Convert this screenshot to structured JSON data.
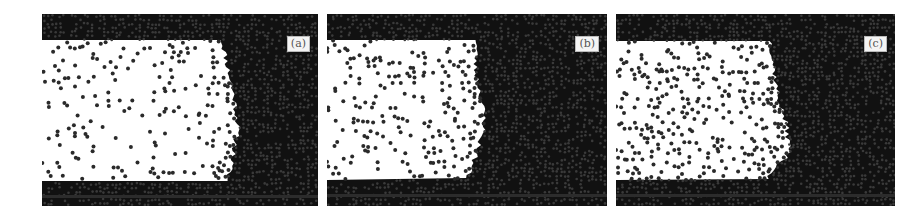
{
  "figure": {
    "background": "#ffffff",
    "particle_color": "#2a2a2a",
    "dense_color": "#111111",
    "void_color": "#ffffff",
    "panels": [
      {
        "id": "a",
        "label": "(a)",
        "left": 42,
        "width": 276,
        "front": [
          180,
          186,
          192,
          196,
          192,
          185
        ],
        "void_top": 26,
        "void_bottom": 167,
        "dot_density": 0.35,
        "seed": 11
      },
      {
        "id": "b",
        "label": "(b)",
        "left": 327,
        "width": 280,
        "front": [
          150,
          148,
          154,
          158,
          150,
          140
        ],
        "void_top": 26,
        "void_bottom": 166,
        "dot_density": 0.5,
        "seed": 23
      },
      {
        "id": "c",
        "label": "(c)",
        "left": 616,
        "width": 279,
        "front": [
          155,
          158,
          162,
          170,
          174,
          150
        ],
        "void_top": 27,
        "void_bottom": 166,
        "dot_density": 0.7,
        "seed": 37
      }
    ]
  }
}
